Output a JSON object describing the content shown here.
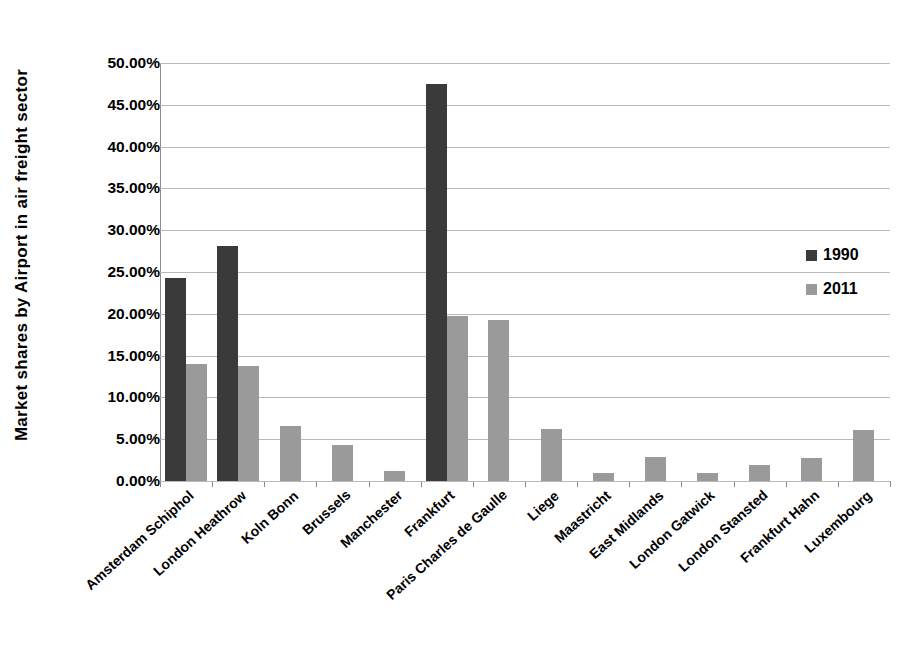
{
  "chart_data": {
    "type": "bar",
    "title": "",
    "xlabel": "",
    "ylabel": "Market shares  by  Airport  in air freight sector",
    "ylim": [
      0,
      50
    ],
    "ytick_step": 5,
    "ytick_labels": [
      "0.00%",
      "5.00%",
      "10.00%",
      "15.00%",
      "20.00%",
      "25.00%",
      "30.00%",
      "35.00%",
      "40.00%",
      "45.00%",
      "50.00%"
    ],
    "grid": true,
    "legend_position": "right-middle",
    "value_suffix": "%",
    "categories": [
      "Amsterdam Schiphol",
      "London Heathrow",
      "Koln Bonn",
      "Brussels",
      "Manchester",
      "Frankfurt",
      "Paris Charles de Gaulle",
      "Liege",
      "Maastricht",
      "East Midlands",
      "London Gatwick",
      "London Stansted",
      "Frankfurt Hahn",
      "Luxembourg"
    ],
    "series": [
      {
        "name": "1990",
        "color": "#3a3a3a",
        "values": [
          24.3,
          28.1,
          null,
          null,
          null,
          47.5,
          null,
          null,
          null,
          null,
          null,
          null,
          null,
          null
        ]
      },
      {
        "name": "2011",
        "color": "#9a9a9a",
        "values": [
          14.0,
          13.7,
          6.6,
          4.35,
          1.2,
          19.7,
          19.3,
          6.2,
          0.95,
          2.85,
          1.0,
          1.95,
          2.7,
          6.05
        ]
      }
    ]
  },
  "legend": {
    "entries": [
      {
        "label": "1990",
        "color": "#3a3a3a"
      },
      {
        "label": "2011",
        "color": "#9a9a9a"
      }
    ]
  },
  "axis": {
    "y_title": "Market shares  by  Airport  in air freight sector"
  }
}
